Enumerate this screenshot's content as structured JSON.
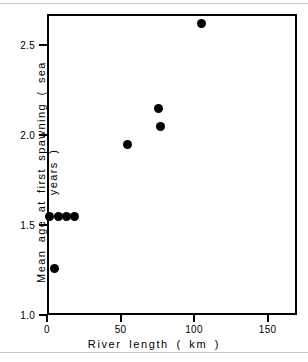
{
  "figure": {
    "background_color": "#ffffff",
    "frame_color": "#000000",
    "marker_color": "#000000",
    "page_rule_color": "#c9c9c9"
  },
  "chart_data": {
    "type": "scatter",
    "title": "",
    "xlabel": "River  length  ( km )",
    "ylabel": "Mean  age  at  first  spawning  ( sea years )",
    "xlim": [
      0,
      170
    ],
    "ylim": [
      1.0,
      2.62
    ],
    "xticks": [
      0,
      50,
      100,
      150
    ],
    "xticklabels": [
      "0",
      "50",
      "100",
      "150"
    ],
    "yticks": [
      1.0,
      1.5,
      2.0,
      2.5
    ],
    "yticklabels": [
      "1.0",
      "1.5",
      "2.0",
      "2.5"
    ],
    "grid": false,
    "legend": null,
    "marker": "filled-circle",
    "points": [
      {
        "x": 5,
        "y": 1.26
      },
      {
        "x": 2,
        "y": 1.55
      },
      {
        "x": 8,
        "y": 1.55
      },
      {
        "x": 13,
        "y": 1.55
      },
      {
        "x": 19,
        "y": 1.55
      },
      {
        "x": 55,
        "y": 1.95
      },
      {
        "x": 76,
        "y": 2.15
      },
      {
        "x": 77,
        "y": 2.05
      },
      {
        "x": 105,
        "y": 2.62
      }
    ]
  }
}
